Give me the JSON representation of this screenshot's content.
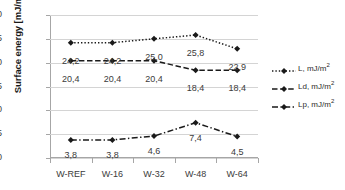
{
  "chart_data": {
    "type": "line",
    "title": "",
    "xlabel": "",
    "ylabel": "Surface energy [mJ/m²]",
    "categories": [
      "W-REF",
      "W-16",
      "W-32",
      "W-48",
      "W-64"
    ],
    "ylim": [
      0,
      30
    ],
    "yticks": [
      "0",
      "5",
      "10",
      "15",
      "20",
      "25",
      "30"
    ],
    "grid": "horizontal",
    "legend_position": "right",
    "series": [
      {
        "name": "L, mJ/m²",
        "style": "dotted",
        "marker": "diamond",
        "color": "#1a1a1a",
        "values": [
          24.2,
          24.2,
          25.0,
          25.8,
          22.9
        ],
        "labels": [
          "24,2",
          "24,2",
          "25,0",
          "25,8",
          "22,9"
        ]
      },
      {
        "name": "Ld, mJ/m²",
        "style": "dashed",
        "marker": "diamond",
        "color": "#1a1a1a",
        "values": [
          20.4,
          20.4,
          20.4,
          18.4,
          18.4
        ],
        "labels": [
          "20,4",
          "20,4",
          "20,4",
          "18,4",
          "18,4"
        ]
      },
      {
        "name": "Lp, mJ/m²",
        "style": "dash-dot",
        "marker": "diamond",
        "color": "#1a1a1a",
        "values": [
          3.8,
          3.8,
          4.6,
          7.4,
          4.5
        ],
        "labels": [
          "3,8",
          "3,8",
          "4,6",
          "7,4",
          "4,5"
        ]
      }
    ]
  },
  "axis": {
    "y_title": "Surface energy [mJ/m²]",
    "yticks": [
      "30",
      "25",
      "20",
      "15",
      "10",
      "5",
      "0"
    ],
    "xticks": [
      "W-REF",
      "W-16",
      "W-32",
      "W-48",
      "W-64"
    ]
  },
  "legend": {
    "items": [
      {
        "label_main": "L, mJ/m",
        "label_sup": "2",
        "style": "dotted"
      },
      {
        "label_main": "Ld, mJ/m",
        "label_sup": "2",
        "style": "dashed"
      },
      {
        "label_main": "Lp, mJ/m",
        "label_sup": "2",
        "style": "dash-dot"
      }
    ]
  },
  "labels": {
    "L": [
      "24,2",
      "24,2",
      "25,0",
      "25,8",
      "22,9"
    ],
    "Ld": [
      "20,4",
      "20,4",
      "20,4",
      "18,4",
      "18,4"
    ],
    "Lp": [
      "3,8",
      "3,8",
      "4,6",
      "7,4",
      "4,5"
    ]
  },
  "colors": {
    "series": "#1a1a1a",
    "gridline": "#d4d4d4",
    "axis": "#a6a6a6",
    "text": "#3b3b3b"
  }
}
